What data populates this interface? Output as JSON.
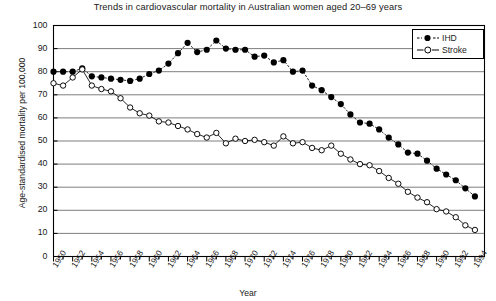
{
  "chart_data": {
    "type": "line",
    "title": "Trends in cardiovascular mortality in Australian women aged 20–69 years",
    "xlabel": "Year",
    "ylabel": "Age-standardised mortality per 100,000",
    "xlim": [
      1950,
      1995
    ],
    "ylim": [
      0,
      100
    ],
    "yticks": [
      0,
      10,
      20,
      30,
      40,
      50,
      60,
      70,
      80,
      90,
      100
    ],
    "xticks": [
      1950,
      1952,
      1954,
      1956,
      1958,
      1960,
      1962,
      1964,
      1966,
      1968,
      1970,
      1972,
      1974,
      1976,
      1978,
      1980,
      1982,
      1984,
      1986,
      1988,
      1990,
      1992,
      1994
    ],
    "minor_xticks_every": 1,
    "grid": "horizontal",
    "legend_position": "top-right",
    "x": [
      1950,
      1951,
      1952,
      1953,
      1954,
      1955,
      1956,
      1957,
      1958,
      1959,
      1960,
      1961,
      1962,
      1963,
      1964,
      1965,
      1966,
      1967,
      1968,
      1969,
      1970,
      1971,
      1972,
      1973,
      1974,
      1975,
      1976,
      1977,
      1978,
      1979,
      1980,
      1981,
      1982,
      1983,
      1984,
      1985,
      1986,
      1987,
      1988,
      1989,
      1990,
      1991,
      1992,
      1993,
      1994
    ],
    "series": [
      {
        "name": "IHD",
        "marker": "filled-circle",
        "color": "#000000",
        "values": [
          80.0,
          80.0,
          80.0,
          81.5,
          78.0,
          77.5,
          77.0,
          76.5,
          76.0,
          77.0,
          79.0,
          80.5,
          83.5,
          88.0,
          92.5,
          88.5,
          89.5,
          93.5,
          90.0,
          89.5,
          89.5,
          86.5,
          87.0,
          84.0,
          85.0,
          80.0,
          80.5,
          74.0,
          72.0,
          69.0,
          66.0,
          61.5,
          58.0,
          57.5,
          55.0,
          51.5,
          48.5,
          45.0,
          44.5,
          41.5,
          38.0,
          35.5,
          33.0,
          29.5,
          26.0
        ]
      },
      {
        "name": "Stroke",
        "marker": "open-circle",
        "color": "#000000",
        "values": [
          75.0,
          74.0,
          77.5,
          81.0,
          74.0,
          72.5,
          71.5,
          68.5,
          64.5,
          62.0,
          61.0,
          58.5,
          58.0,
          56.5,
          55.0,
          53.0,
          51.5,
          53.5,
          49.0,
          51.0,
          50.0,
          50.5,
          49.5,
          48.0,
          52.0,
          49.0,
          49.5,
          47.0,
          46.0,
          48.0,
          44.5,
          42.0,
          40.0,
          39.5,
          37.0,
          34.0,
          31.5,
          28.0,
          25.5,
          23.5,
          20.5,
          19.5,
          17.0,
          13.5,
          11.5
        ]
      }
    ],
    "legend": [
      {
        "label": "IHD",
        "marker": "filled-circle"
      },
      {
        "label": "Stroke",
        "marker": "open-circle"
      }
    ]
  }
}
